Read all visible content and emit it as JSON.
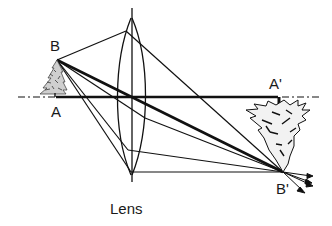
{
  "diagram": {
    "title": "Lens",
    "labels": {
      "object_top": "B",
      "object_base": "A",
      "image_base": "A'",
      "image_top": "B'",
      "lens": "Lens"
    },
    "colors": {
      "line": "#111111",
      "background": "#ffffff"
    },
    "elements": {
      "optical_axis": "dash-dot horizontal line through lens center",
      "object": "upright tree between A and B",
      "image": "inverted tree between A' and B'",
      "rays": [
        "B to lens top to B'",
        "B through lens center to B' (bold)",
        "B to lens lower-middle to B'",
        "B to lens bottom, parallel to axis, to B'"
      ]
    }
  }
}
